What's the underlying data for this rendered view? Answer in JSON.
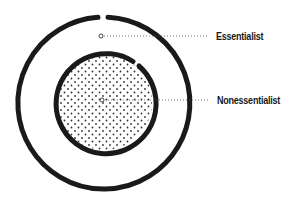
{
  "diagram": {
    "labels": {
      "outer": "Essentialist",
      "inner": "Nonessentialist"
    },
    "colors": {
      "stroke": "#1a1a1a",
      "dots": "#333333",
      "leader": "#555555",
      "background": "#ffffff"
    },
    "shapes": {
      "outer_circle": {
        "cx": 104,
        "cy": 103,
        "r": 86,
        "stroke_width": 5,
        "gap_at": "top"
      },
      "inner_circle": {
        "cx": 104,
        "cy": 102,
        "r": 50,
        "stroke_width": 5,
        "gap_at": "top-right",
        "fill": "dotted"
      },
      "outer_marker": {
        "cx": 101,
        "cy": 36
      },
      "inner_marker": {
        "cx": 102,
        "cy": 100
      }
    }
  }
}
